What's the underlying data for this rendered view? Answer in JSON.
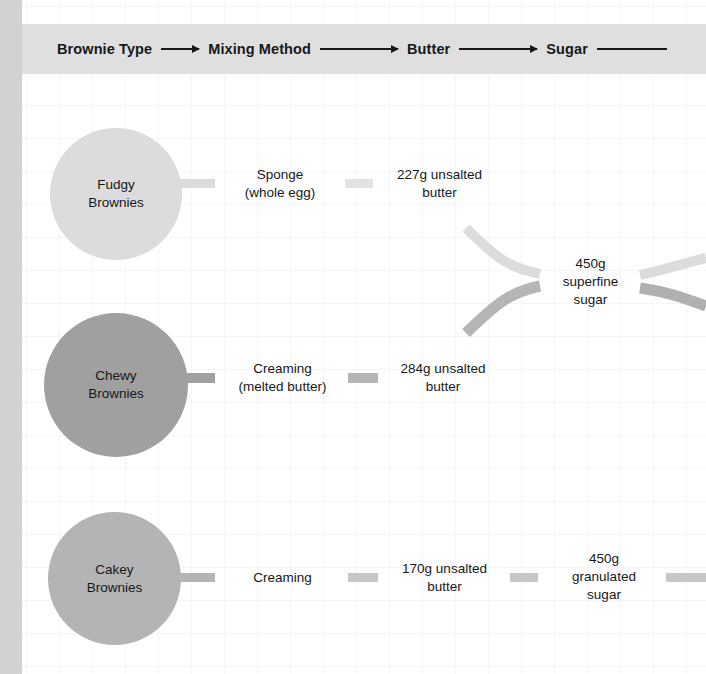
{
  "header": {
    "columns": [
      {
        "label": "Brownie Type"
      },
      {
        "label": "Mixing Method"
      },
      {
        "label": "Butter"
      },
      {
        "label": "Sugar"
      }
    ]
  },
  "colors": {
    "fudgy": "#dcdcdc",
    "chewy": "#a0a0a0",
    "cakey": "#b4b4b4",
    "header_band": "#dfdfdf",
    "left_strip": "#d2d2d2",
    "grid_line": "#f4f5f6",
    "text": "#16181c"
  },
  "rows": [
    {
      "id": "fudgy",
      "brownie_type": "Fudgy\nBrownies",
      "brownie_type_line1": "Fudgy",
      "brownie_type_line2": "Brownies",
      "mixing_method_line1": "Sponge",
      "mixing_method_line2": "(whole egg)",
      "butter_line1": "227g unsalted",
      "butter_line2": "butter"
    },
    {
      "id": "chewy",
      "brownie_type_line1": "Chewy",
      "brownie_type_line2": "Brownies",
      "mixing_method_line1": "Creaming",
      "mixing_method_line2": "(melted butter)",
      "butter_line1": "284g unsalted",
      "butter_line2": "butter"
    },
    {
      "id": "cakey",
      "brownie_type_line1": "Cakey",
      "brownie_type_line2": "Brownies",
      "mixing_method_line1": "Creaming",
      "mixing_method_line2": "",
      "butter_line1": "170g unsalted",
      "butter_line2": "butter"
    }
  ],
  "sugar_nodes": [
    {
      "id": "superfine",
      "line1": "450g",
      "line2": "superfine",
      "line3": "sugar"
    },
    {
      "id": "granulated",
      "line1": "450g",
      "line2": "granulated",
      "line3": "sugar"
    }
  ]
}
